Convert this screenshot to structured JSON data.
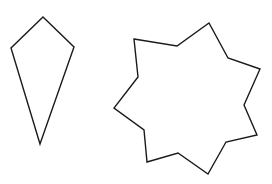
{
  "canvas": {
    "width": 272,
    "height": 184,
    "background": "#ffffff"
  },
  "stroke": {
    "color": "#1a1a1a",
    "width": 1.4
  },
  "shapes": [
    {
      "name": "kite",
      "points": "43,17 74,47 40,144 11,48"
    },
    {
      "name": "seven-point-star",
      "points": "134,39 177,46 209,23 228,58 260,69 244,105 257,135 226,142 208,174 178,153 147,162 144,130 114,108 138,77"
    }
  ]
}
